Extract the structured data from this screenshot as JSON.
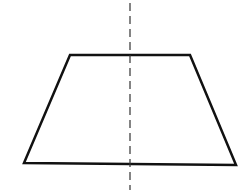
{
  "diagram": {
    "colors": {
      "stroke": "#111111",
      "background": "#ffffff",
      "axis": "#333333"
    },
    "trapezoid": {
      "points": [
        [
          70,
          55
        ],
        [
          190,
          55
        ],
        [
          236,
          165
        ],
        [
          24,
          163
        ]
      ],
      "stroke_width": 2.5
    },
    "symmetry_axis": {
      "x": 130,
      "y1": 3,
      "y2": 190,
      "dash": "8,5",
      "stroke_width": 1.2
    }
  }
}
